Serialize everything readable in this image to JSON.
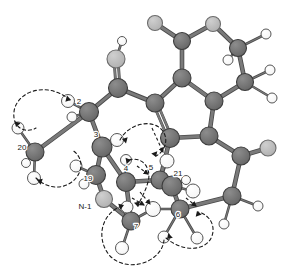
{
  "figure": {
    "type": "molecular-structure-3d-ball-and-stick",
    "title": "",
    "background_color": "#ffffff",
    "colors": {
      "carbon": "#6e6e6e",
      "carbon_stroke": "#3d3d3d",
      "heteroatom": "#b8b8b8",
      "heteroatom_stroke": "#6b6b6b",
      "hydrogen": "#ffffff",
      "hydrogen_stroke": "#555555",
      "bond": "#7a7a7a",
      "bond_stroke": "#4a4a4a",
      "dashed": "#1a1a1a",
      "label": "#1a1a1a"
    }
  },
  "atom_labels": [
    {
      "id": "label-20",
      "text": "20",
      "x": 22,
      "y": 150
    },
    {
      "id": "label-2",
      "text": "2",
      "x": 79,
      "y": 104
    },
    {
      "id": "label-3",
      "text": "3",
      "x": 96,
      "y": 137
    },
    {
      "id": "label-19",
      "text": "19",
      "x": 88,
      "y": 181
    },
    {
      "id": "label-4",
      "text": "4",
      "x": 126,
      "y": 171
    },
    {
      "id": "label-N1",
      "text": "N-1",
      "x": 85,
      "y": 209
    },
    {
      "id": "label-7",
      "text": "7",
      "x": 136,
      "y": 229
    },
    {
      "id": "label-5",
      "text": "5",
      "x": 151,
      "y": 170
    },
    {
      "id": "label-21",
      "text": "21",
      "x": 178,
      "y": 176
    },
    {
      "id": "label-6",
      "text": "6",
      "x": 178,
      "y": 217
    }
  ],
  "atoms": [
    {
      "id": "a-o-top",
      "kind": "heteroatom",
      "x": 155,
      "y": 23,
      "r": 7.5
    },
    {
      "id": "a-o-topright",
      "kind": "heteroatom",
      "x": 213,
      "y": 24,
      "r": 7.5
    },
    {
      "id": "a-c-ring-tl",
      "kind": "carbon",
      "x": 182,
      "y": 41,
      "r": 8.5
    },
    {
      "id": "a-c-ring-tr",
      "kind": "carbon",
      "x": 238,
      "y": 48,
      "r": 8.5
    },
    {
      "id": "a-h-tr-1",
      "kind": "hydrogen",
      "x": 266,
      "y": 34,
      "r": 5.0
    },
    {
      "id": "a-h-tr-2",
      "kind": "hydrogen",
      "x": 228,
      "y": 60,
      "r": 5.0
    },
    {
      "id": "a-c-ring-ml",
      "kind": "carbon",
      "x": 182,
      "y": 78,
      "r": 9.0
    },
    {
      "id": "a-c-ring-mr",
      "kind": "carbon",
      "x": 245,
      "y": 82,
      "r": 8.5
    },
    {
      "id": "a-h-mr-1",
      "kind": "hydrogen",
      "x": 270,
      "y": 70,
      "r": 5.0
    },
    {
      "id": "a-h-mr-2",
      "kind": "hydrogen",
      "x": 272,
      "y": 98,
      "r": 5.0
    },
    {
      "id": "a-c-pyr-left",
      "kind": "carbon",
      "x": 155,
      "y": 103,
      "r": 9.0
    },
    {
      "id": "a-c-pyr-right",
      "kind": "carbon",
      "x": 214,
      "y": 101,
      "r": 9.0
    },
    {
      "id": "a-c-pyr-bl",
      "kind": "carbon",
      "x": 170,
      "y": 138,
      "r": 9.5
    },
    {
      "id": "a-c-pyr-br",
      "kind": "carbon",
      "x": 209,
      "y": 136,
      "r": 9.0
    },
    {
      "id": "a-c-oh",
      "kind": "heteroatom",
      "x": 116,
      "y": 59,
      "r": 9.0
    },
    {
      "id": "a-h-oh",
      "kind": "hydrogen",
      "x": 122,
      "y": 41,
      "r": 4.5
    },
    {
      "id": "a-c2",
      "kind": "carbon",
      "x": 118,
      "y": 88,
      "r": 9.5
    },
    {
      "id": "a-c-right-top",
      "kind": "carbon",
      "x": 241,
      "y": 156,
      "r": 9.0
    },
    {
      "id": "a-o-right",
      "kind": "heteroatom",
      "x": 268,
      "y": 148,
      "r": 8.0
    },
    {
      "id": "a-c-right-bot",
      "kind": "carbon",
      "x": 232,
      "y": 196,
      "r": 9.0
    },
    {
      "id": "a-h-rb-1",
      "kind": "hydrogen",
      "x": 258,
      "y": 206,
      "r": 5.0
    },
    {
      "id": "a-h-rb-2",
      "kind": "hydrogen",
      "x": 224,
      "y": 224,
      "r": 5.0
    },
    {
      "id": "a-c2-main",
      "kind": "carbon",
      "x": 89,
      "y": 112,
      "r": 9.5
    },
    {
      "id": "a-h-c2a",
      "kind": "hydrogen",
      "x": 68,
      "y": 101,
      "r": 6.5
    },
    {
      "id": "a-h-c2b",
      "kind": "hydrogen",
      "x": 72,
      "y": 117,
      "r": 5.0
    },
    {
      "id": "a-c-20",
      "kind": "carbon",
      "x": 35,
      "y": 152,
      "r": 9.0
    },
    {
      "id": "a-h-20a",
      "kind": "hydrogen",
      "x": 18,
      "y": 128,
      "r": 6.0
    },
    {
      "id": "a-h-20b",
      "kind": "hydrogen",
      "x": 26,
      "y": 163,
      "r": 4.5
    },
    {
      "id": "a-h-20c",
      "kind": "hydrogen",
      "x": 34,
      "y": 178,
      "r": 6.5
    },
    {
      "id": "a-c3",
      "kind": "carbon",
      "x": 102,
      "y": 147,
      "r": 10.0
    },
    {
      "id": "a-h-c3",
      "kind": "hydrogen",
      "x": 117,
      "y": 140,
      "r": 6.5
    },
    {
      "id": "a-c19",
      "kind": "carbon",
      "x": 96,
      "y": 175,
      "r": 9.5
    },
    {
      "id": "a-h-19a",
      "kind": "hydrogen",
      "x": 76,
      "y": 166,
      "r": 6.0
    },
    {
      "id": "a-h-19b",
      "kind": "hydrogen",
      "x": 84,
      "y": 184,
      "r": 5.0
    },
    {
      "id": "a-c4",
      "kind": "carbon",
      "x": 126,
      "y": 182,
      "r": 9.5
    },
    {
      "id": "a-h-c4",
      "kind": "hydrogen",
      "x": 126,
      "y": 160,
      "r": 5.5
    },
    {
      "id": "a-n1",
      "kind": "heteroatom",
      "x": 104,
      "y": 199,
      "r": 8.5
    },
    {
      "id": "a-c7",
      "kind": "carbon",
      "x": 131,
      "y": 221,
      "r": 9.0
    },
    {
      "id": "a-h-c7a",
      "kind": "hydrogen",
      "x": 127,
      "y": 207,
      "r": 6.0
    },
    {
      "id": "a-h-c7b",
      "kind": "hydrogen",
      "x": 122,
      "y": 248,
      "r": 6.5
    },
    {
      "id": "a-c5",
      "kind": "carbon",
      "x": 160,
      "y": 180,
      "r": 9.0
    },
    {
      "id": "a-h-c5",
      "kind": "hydrogen",
      "x": 167,
      "y": 161,
      "r": 7.0
    },
    {
      "id": "a-c21",
      "kind": "carbon",
      "x": 172,
      "y": 186,
      "r": 10.0
    },
    {
      "id": "a-h-21a",
      "kind": "hydrogen",
      "x": 193,
      "y": 191,
      "r": 7.0
    },
    {
      "id": "a-h-21b",
      "kind": "hydrogen",
      "x": 186,
      "y": 180,
      "r": 4.5
    },
    {
      "id": "a-h-mid",
      "kind": "hydrogen",
      "x": 153,
      "y": 209,
      "r": 7.5
    },
    {
      "id": "a-c6",
      "kind": "carbon",
      "x": 180,
      "y": 209,
      "r": 9.0
    },
    {
      "id": "a-h-c6a",
      "kind": "hydrogen",
      "x": 164,
      "y": 237,
      "r": 6.0
    },
    {
      "id": "a-h-c6b",
      "kind": "hydrogen",
      "x": 197,
      "y": 238,
      "r": 6.0
    }
  ],
  "bonds": [
    {
      "from": "a-o-top",
      "to": "a-c-ring-tl",
      "order": 1
    },
    {
      "from": "a-c-ring-tl",
      "to": "a-o-topright",
      "order": 1
    },
    {
      "from": "a-o-topright",
      "to": "a-c-ring-tr",
      "order": 1
    },
    {
      "from": "a-c-ring-tr",
      "to": "a-h-tr-1",
      "order": 1
    },
    {
      "from": "a-c-ring-tr",
      "to": "a-h-tr-2",
      "order": 1
    },
    {
      "from": "a-c-ring-tr",
      "to": "a-c-ring-mr",
      "order": 1
    },
    {
      "from": "a-c-ring-tl",
      "to": "a-c-ring-ml",
      "order": 1
    },
    {
      "from": "a-c-ring-ml",
      "to": "a-c-pyr-left",
      "order": 1
    },
    {
      "from": "a-c-ring-ml",
      "to": "a-c-pyr-right",
      "order": 1
    },
    {
      "from": "a-c-ring-mr",
      "to": "a-c-pyr-right",
      "order": 1
    },
    {
      "from": "a-c-ring-mr",
      "to": "a-h-mr-1",
      "order": 1
    },
    {
      "from": "a-c-ring-mr",
      "to": "a-h-mr-2",
      "order": 1
    },
    {
      "from": "a-c-pyr-left",
      "to": "a-c-pyr-bl",
      "order": 2
    },
    {
      "from": "a-c-pyr-right",
      "to": "a-c-pyr-br",
      "order": 1
    },
    {
      "from": "a-c-pyr-bl",
      "to": "a-c-pyr-br",
      "order": 1
    },
    {
      "from": "a-c-pyr-left",
      "to": "a-c2",
      "order": 1
    },
    {
      "from": "a-c2",
      "to": "a-c-oh",
      "order": 2
    },
    {
      "from": "a-c-oh",
      "to": "a-h-oh",
      "order": 1
    },
    {
      "from": "a-c2",
      "to": "a-c2-main",
      "order": 1
    },
    {
      "from": "a-c-pyr-br",
      "to": "a-c-right-top",
      "order": 1
    },
    {
      "from": "a-c-right-top",
      "to": "a-o-right",
      "order": 1
    },
    {
      "from": "a-c-right-top",
      "to": "a-c-right-bot",
      "order": 1
    },
    {
      "from": "a-c-right-bot",
      "to": "a-h-rb-1",
      "order": 1
    },
    {
      "from": "a-c-right-bot",
      "to": "a-h-rb-2",
      "order": 1
    },
    {
      "from": "a-c-right-bot",
      "to": "a-c6",
      "order": 1
    },
    {
      "from": "a-c2-main",
      "to": "a-h-c2a",
      "order": 1
    },
    {
      "from": "a-c2-main",
      "to": "a-h-c2b",
      "order": 1
    },
    {
      "from": "a-c2-main",
      "to": "a-c-20",
      "order": 1
    },
    {
      "from": "a-c2-main",
      "to": "a-c3",
      "order": 1
    },
    {
      "from": "a-c-20",
      "to": "a-h-20a",
      "order": 1
    },
    {
      "from": "a-c-20",
      "to": "a-h-20b",
      "order": 1
    },
    {
      "from": "a-c-20",
      "to": "a-h-20c",
      "order": 1
    },
    {
      "from": "a-c3",
      "to": "a-h-c3",
      "order": 1
    },
    {
      "from": "a-c3",
      "to": "a-c19",
      "order": 1
    },
    {
      "from": "a-c3",
      "to": "a-c4",
      "order": 1
    },
    {
      "from": "a-c19",
      "to": "a-h-19a",
      "order": 1
    },
    {
      "from": "a-c19",
      "to": "a-h-19b",
      "order": 1
    },
    {
      "from": "a-c19",
      "to": "a-n1",
      "order": 1
    },
    {
      "from": "a-c4",
      "to": "a-h-c4",
      "order": 1
    },
    {
      "from": "a-c4",
      "to": "a-c5",
      "order": 1
    },
    {
      "from": "a-c4",
      "to": "a-c7",
      "order": 1
    },
    {
      "from": "a-n1",
      "to": "a-c7",
      "order": 1
    },
    {
      "from": "a-c7",
      "to": "a-h-c7a",
      "order": 1
    },
    {
      "from": "a-c7",
      "to": "a-h-c7b",
      "order": 1
    },
    {
      "from": "a-c7",
      "to": "a-h-mid",
      "order": 1
    },
    {
      "from": "a-c5",
      "to": "a-h-c5",
      "order": 1
    },
    {
      "from": "a-c5",
      "to": "a-c21",
      "order": 1
    },
    {
      "from": "a-c5",
      "to": "a-c-pyr-bl",
      "order": 1
    },
    {
      "from": "a-c21",
      "to": "a-h-21a",
      "order": 1
    },
    {
      "from": "a-c21",
      "to": "a-h-21b",
      "order": 1
    },
    {
      "from": "a-c21",
      "to": "a-c6",
      "order": 1
    },
    {
      "from": "a-h-mid",
      "to": "a-c6",
      "order": 1
    },
    {
      "from": "a-c6",
      "to": "a-h-c6a",
      "order": 1
    },
    {
      "from": "a-c6",
      "to": "a-h-c6b",
      "order": 1
    }
  ],
  "noe_loops": [
    {
      "id": "noe-loop-upper-left",
      "path": "M 70,100 C 46,80 16,92 14,112 C 12,128 26,134 36,128",
      "arrows": [
        {
          "x": 71,
          "y": 100,
          "angle": 15
        },
        {
          "x": 16,
          "y": 127,
          "angle": 108
        }
      ]
    },
    {
      "id": "noe-loop-lower-left",
      "path": "M 36,178 C 48,190 66,190 76,178 C 84,168 82,156 72,150",
      "arrows": [
        {
          "x": 37,
          "y": 180,
          "angle": 200
        }
      ]
    },
    {
      "id": "noe-loop-center",
      "path": "M 120,140 C 128,124 152,118 162,130 C 170,140 164,152 156,156",
      "arrows": [
        {
          "x": 122,
          "y": 139,
          "angle": 195
        },
        {
          "x": 156,
          "y": 157,
          "angle": 70
        }
      ]
    },
    {
      "id": "noe-loop-center-small",
      "path": "M 129,160 C 142,156 152,168 148,182 C 145,193 140,200 138,206",
      "arrows": [
        {
          "x": 138,
          "y": 207,
          "angle": 80
        },
        {
          "x": 131,
          "y": 160,
          "angle": 350
        }
      ]
    },
    {
      "id": "noe-loop-bottom",
      "path": "M 122,206 C 100,214 96,240 110,256 C 128,274 162,262 164,240",
      "arrows": [
        {
          "x": 124,
          "y": 205,
          "angle": 340
        }
      ]
    },
    {
      "id": "noe-loop-bottom-right",
      "path": "M 166,238 C 182,252 206,252 212,236 C 216,224 208,214 198,212",
      "arrows": [
        {
          "x": 167,
          "y": 239,
          "angle": 135
        },
        {
          "x": 197,
          "y": 211,
          "angle": 250
        }
      ]
    }
  ],
  "noe_arrows": [
    {
      "id": "arrow-to-c5",
      "x1": 152,
      "y1": 128,
      "x2": 163,
      "y2": 152
    },
    {
      "id": "arrow-to-c21",
      "x1": 186,
      "y1": 198,
      "x2": 196,
      "y2": 206
    },
    {
      "id": "arrow-to-mid1",
      "x1": 140,
      "y1": 192,
      "x2": 150,
      "y2": 204
    },
    {
      "id": "arrow-to-mid2",
      "x1": 132,
      "y1": 198,
      "x2": 144,
      "y2": 205
    },
    {
      "id": "arrow-to-h4",
      "x1": 137,
      "y1": 166,
      "x2": 148,
      "y2": 174
    }
  ]
}
